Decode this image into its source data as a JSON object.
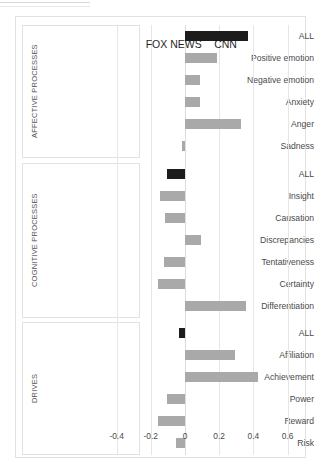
{
  "chart_data": {
    "type": "bar",
    "orientation": "horizontal",
    "title": "",
    "xlabel": "",
    "ylabel": "",
    "xlim": [
      -0.45,
      0.68
    ],
    "grid": true,
    "gridlines": "vertical",
    "xticks": [
      -0.4,
      -0.2,
      0,
      0.2,
      0.4,
      0.6
    ],
    "xtick_labels": [
      "-0.4",
      "-0.2",
      "0",
      "0.2",
      "0.4",
      "0.6"
    ],
    "annotations": [
      {
        "text": "FOX NEWS",
        "meaning": "negative side of axis"
      },
      {
        "text": "CNN",
        "meaning": "positive side of axis"
      }
    ],
    "legend": "none",
    "bar_colors": {
      "summary": "#1c1c1c",
      "subcategory": "#a9a9a9"
    },
    "groups": [
      {
        "name": "AFFECTIVE PROCESSES",
        "categories": [
          "ALL",
          "Positive emotion",
          "Negative emotion",
          "Anxiety",
          "Anger",
          "Sadness"
        ],
        "values": [
          0.37,
          0.19,
          0.09,
          0.09,
          0.33,
          -0.015
        ],
        "emphasis": [
          true,
          false,
          false,
          false,
          false,
          false
        ]
      },
      {
        "name": "COGNITIVE PROCESSES",
        "categories": [
          "ALL",
          "Insight",
          "Causation",
          "Discrepancies",
          "Tentativeness",
          "Certainty",
          "Differentiation"
        ],
        "values": [
          -0.105,
          -0.145,
          -0.115,
          0.095,
          -0.12,
          -0.155,
          0.355
        ],
        "emphasis": [
          true,
          false,
          false,
          false,
          false,
          false,
          false
        ]
      },
      {
        "name": "DRIVES",
        "categories": [
          "ALL",
          "Affiliation",
          "Achievement",
          "Power",
          "Reward",
          "Risk"
        ],
        "values": [
          -0.035,
          0.29,
          0.425,
          -0.105,
          -0.155,
          -0.05
        ],
        "emphasis": [
          true,
          false,
          false,
          false,
          false,
          false
        ]
      }
    ]
  },
  "axis": {
    "ticks": [
      "-0.4",
      "-0.2",
      "0",
      "0.2",
      "0.4",
      "0.6"
    ]
  },
  "annotations": {
    "fox_news": "FOX NEWS",
    "cnn": "CNN"
  },
  "groups": {
    "affective": {
      "title": "AFFECTIVE PROCESSES",
      "rows": [
        "ALL",
        "Positive emotion",
        "Negative emotion",
        "Anxiety",
        "Anger",
        "Sadness"
      ]
    },
    "cognitive": {
      "title": "COGNITIVE PROCESSES",
      "rows": [
        "ALL",
        "Insight",
        "Causation",
        "Discrepancies",
        "Tentativeness",
        "Certainty",
        "Differentiation"
      ]
    },
    "drives": {
      "title": "DRIVES",
      "rows": [
        "ALL",
        "Affiliation",
        "Achievement",
        "Power",
        "Reward",
        "Risk"
      ]
    }
  }
}
